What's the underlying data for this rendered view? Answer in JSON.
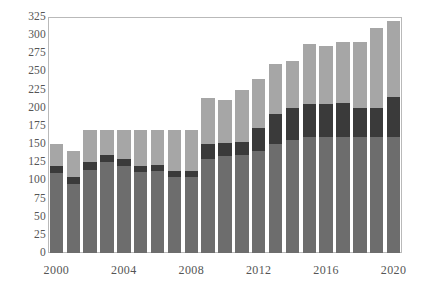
{
  "chart_data": {
    "type": "bar",
    "subtype": "stacked-vertical",
    "title": "",
    "xlabel": "",
    "ylabel": "",
    "ylim": [
      0,
      325
    ],
    "ytick_step": 25,
    "yticks": [
      0,
      25,
      50,
      75,
      100,
      125,
      150,
      175,
      200,
      225,
      250,
      275,
      300,
      325
    ],
    "ytick_labels": [
      "0",
      "25",
      "50",
      "75",
      "100",
      "125",
      "150",
      "175",
      "200",
      "225",
      "250",
      "275",
      "300",
      "325"
    ],
    "grid": false,
    "legend": "none",
    "categories": [
      2000,
      2001,
      2002,
      2003,
      2004,
      2005,
      2006,
      2007,
      2008,
      2009,
      2010,
      2011,
      2012,
      2013,
      2014,
      2015,
      2016,
      2017,
      2018,
      2019,
      2020
    ],
    "xtick_labels": [
      "2000",
      "2004",
      "2008",
      "2012",
      "2016",
      "2020"
    ],
    "xticks": [
      2000,
      2004,
      2008,
      2012,
      2016,
      2020
    ],
    "series": [
      {
        "name": "bottom",
        "color": "#6d6d6d",
        "values": [
          110,
          95,
          115,
          125,
          120,
          112,
          113,
          105,
          105,
          130,
          133,
          135,
          140,
          150,
          155,
          160,
          160,
          160,
          160,
          160,
          160
        ]
      },
      {
        "name": "middle",
        "color": "#3a3a3a",
        "values": [
          10,
          10,
          10,
          10,
          10,
          8,
          8,
          8,
          8,
          20,
          18,
          18,
          32,
          42,
          45,
          45,
          45,
          47,
          40,
          40,
          55
        ]
      },
      {
        "name": "top",
        "color": "#a6a6a6",
        "values": [
          30,
          35,
          45,
          35,
          40,
          50,
          49,
          57,
          57,
          63,
          60,
          72,
          68,
          68,
          65,
          83,
          80,
          83,
          90,
          110,
          105
        ]
      }
    ],
    "totals": [
      150,
      140,
      170,
      170,
      170,
      170,
      170,
      170,
      170,
      213,
      211,
      225,
      240,
      260,
      265,
      288,
      285,
      290,
      290,
      310,
      320
    ]
  },
  "colors": {
    "bottom_segment": "#6d6d6d",
    "middle_segment": "#3a3a3a",
    "top_segment": "#a6a6a6",
    "axis_line": "#b9b9b9",
    "tick_text": "#555555",
    "background": "#ffffff"
  }
}
